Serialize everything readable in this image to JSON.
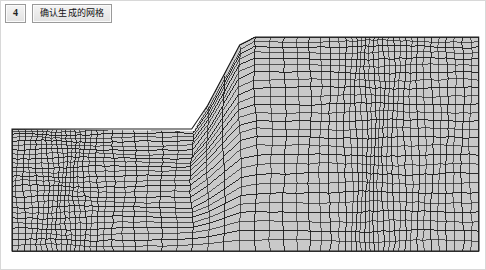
{
  "window": {
    "background_color": "#ffffff",
    "border_color": "#d8d8d8"
  },
  "toolbar": {
    "step_button": {
      "name": "step-number-button",
      "glyph": "4",
      "icon_name": "step-marker-icon"
    },
    "confirm_button": {
      "name": "confirm-generated-mesh-button",
      "label": "确认生成的网格"
    }
  },
  "viewport": {
    "name": "mesh-viewport",
    "element_fill": "#c9c9c9",
    "element_stroke": "#1e1e1e",
    "background": "#ffffff"
  },
  "chart_data": {
    "type": "mesh",
    "title": "确认生成的网格",
    "element_shape": "quadrilateral",
    "grading": "refined toward slope face and toe, coarse at far field",
    "geometry": {
      "units": "pixels",
      "domain_left_x": 11,
      "domain_right_x": 478,
      "domain_bottom_y": 250,
      "lower_block_top_y": 128,
      "crest_top_y": 36,
      "slope_toe": [
        193,
        130
      ],
      "slope_crest": [
        243,
        36
      ],
      "crest_right_x": 478,
      "slope_angle_deg": 62
    },
    "regions": [
      {
        "name": "foundation-block",
        "x_range": [
          11,
          478
        ],
        "y_range": [
          128,
          250
        ],
        "nx": 46,
        "ny": 13
      },
      {
        "name": "embankment-block",
        "x_range": [
          193,
          478
        ],
        "y_range": [
          36,
          130
        ],
        "nx": 40,
        "ny": 14
      }
    ],
    "approx_element_count": 1160,
    "approx_node_count": 1250
  }
}
